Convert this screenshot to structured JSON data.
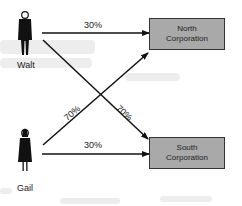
{
  "people": [
    {
      "name": "Walt"
    },
    {
      "name": "Gail"
    }
  ],
  "corporations": [
    {
      "line1": "North",
      "line2": "Corporation"
    },
    {
      "line1": "South",
      "line2": "Corporation"
    }
  ],
  "ownership": [
    {
      "from": "Walt",
      "to": "North Corporation",
      "label": "30%"
    },
    {
      "from": "Walt",
      "to": "South Corporation",
      "label": "70%"
    },
    {
      "from": "Gail",
      "to": "North Corporation",
      "label": "70%"
    },
    {
      "from": "Gail",
      "to": "South Corporation",
      "label": "30%"
    }
  ]
}
